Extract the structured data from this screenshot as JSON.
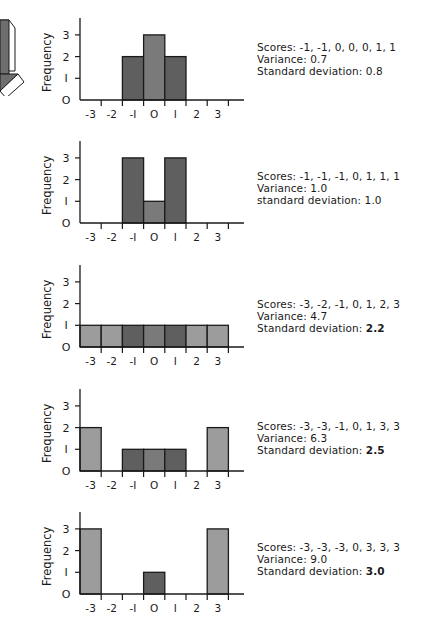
{
  "chart_data": [
    {
      "type": "bar",
      "subtype": "histogram",
      "categories": [
        "-3",
        "-2",
        "-1",
        "0",
        "1",
        "2",
        "3"
      ],
      "values": [
        0,
        0,
        2,
        3,
        2,
        0,
        0
      ],
      "ylabel": "Frequency",
      "yticks": [
        "0",
        "1",
        "2",
        "3"
      ],
      "ylim": [
        0,
        3.5
      ],
      "scores_text": "Scores: -1, -1, 0, 0, 0, 1, 1",
      "variance_text": "Variance: 0.7",
      "sd_label": "Standard deviation:",
      "sd_value": "0.8"
    },
    {
      "type": "bar",
      "subtype": "histogram",
      "categories": [
        "-3",
        "-2",
        "-1",
        "0",
        "1",
        "2",
        "3"
      ],
      "values": [
        0,
        0,
        3,
        1,
        3,
        0,
        0
      ],
      "ylabel": "Frequency",
      "yticks": [
        "0",
        "1",
        "2",
        "3"
      ],
      "ylim": [
        0,
        3.5
      ],
      "scores_text": "Scores: -1, -1, -1, 0, 1, 1, 1",
      "variance_text": "Variance: 1.0",
      "sd_label": "standard deviation:",
      "sd_value": "1.0"
    },
    {
      "type": "bar",
      "subtype": "histogram",
      "categories": [
        "-3",
        "-2",
        "-1",
        "0",
        "1",
        "2",
        "3"
      ],
      "values": [
        1,
        1,
        1,
        1,
        1,
        1,
        1
      ],
      "ylabel": "Frequency",
      "yticks": [
        "0",
        "1",
        "2",
        "3"
      ],
      "ylim": [
        0,
        3.5
      ],
      "scores_text": "Scores: -3, -2, -1, 0, 1, 2, 3",
      "variance_text": "Variance: 4.7",
      "sd_label": "Standard deviation:",
      "sd_value": "2.2"
    },
    {
      "type": "bar",
      "subtype": "histogram",
      "categories": [
        "-3",
        "-2",
        "-1",
        "0",
        "1",
        "2",
        "3"
      ],
      "values": [
        2,
        0,
        1,
        1,
        1,
        0,
        2
      ],
      "ylabel": "Frequency",
      "yticks": [
        "0",
        "1",
        "2",
        "3"
      ],
      "ylim": [
        0,
        3.5
      ],
      "scores_text": "Scores: -3, -3, -1, 0, 1, 3, 3",
      "variance_text": "Variance: 6.3",
      "sd_label": "Standard deviation:",
      "sd_value": "2.5"
    },
    {
      "type": "bar",
      "subtype": "histogram",
      "categories": [
        "-3",
        "-2",
        "-1",
        "0",
        "1",
        "2",
        "3"
      ],
      "values": [
        3,
        0,
        0,
        1,
        0,
        0,
        3
      ],
      "ylabel": "Frequency",
      "yticks": [
        "0",
        "1",
        "2",
        "3"
      ],
      "ylim": [
        0,
        3.5
      ],
      "scores_text": "Scores: -3, -3, -3, 0, 3, 3, 3",
      "variance_text": "Variance: 9.0",
      "sd_label": "Standard deviation:",
      "sd_value": "3.0"
    }
  ],
  "colors": {
    "bar_dark": "#5f5f5f",
    "bar_mid": "#7a7a7a",
    "bar_light": "#9c9c9c",
    "outline": "#1a1a1a",
    "arrow_fill": "#6e6e6e"
  },
  "decoration": {
    "arrow_icon": "down-arrow"
  }
}
